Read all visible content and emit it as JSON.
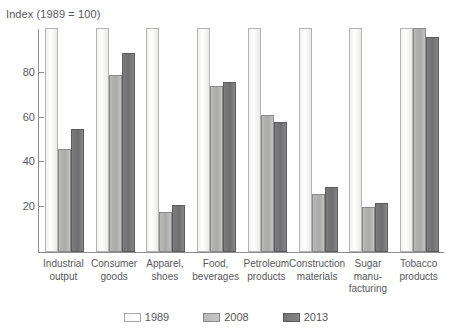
{
  "chart_data": {
    "type": "bar",
    "title": "Index (1989 = 100)",
    "xlabel": "",
    "ylabel": "Index (1989 = 100)",
    "ylim": [
      0,
      100
    ],
    "yticks": [
      20,
      40,
      60,
      80
    ],
    "grid": false,
    "legend_position": "bottom",
    "categories": [
      "Industrial output",
      "Consumer goods",
      "Apparel, shoes",
      "Food, beverages",
      "Petroleum products",
      "Construction materials",
      "Sugar manu-facturing",
      "Tobacco products"
    ],
    "category_lines": [
      [
        "Industrial",
        "output"
      ],
      [
        "Consumer",
        "goods"
      ],
      [
        "Apparel,",
        "shoes"
      ],
      [
        "Food,",
        "beverages"
      ],
      [
        "Petroleum",
        "products"
      ],
      [
        "Construction",
        "materials"
      ],
      [
        "Sugar",
        "manu-",
        "facturing"
      ],
      [
        "Tobacco",
        "products"
      ]
    ],
    "series": [
      {
        "name": "1989",
        "color": "#fbfbf9",
        "values": [
          100,
          100,
          100,
          100,
          100,
          100,
          100,
          100
        ]
      },
      {
        "name": "2008",
        "color": "#b4b4b2",
        "values": [
          46,
          79,
          18,
          74,
          61,
          26,
          20,
          100
        ]
      },
      {
        "name": "2013",
        "color": "#747476",
        "values": [
          55,
          89,
          21,
          76,
          58,
          29,
          22,
          96
        ]
      }
    ]
  },
  "legend": {
    "items": [
      {
        "label": "1989"
      },
      {
        "label": "2008"
      },
      {
        "label": "2013"
      }
    ]
  }
}
